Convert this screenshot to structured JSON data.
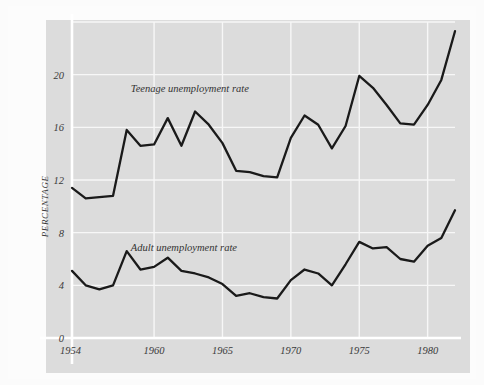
{
  "chart_data": {
    "type": "line",
    "title": "",
    "subtitle": "",
    "xlabel": "",
    "ylabel": "PERCENTAGE",
    "xlim": [
      1954,
      1982
    ],
    "ylim": [
      0,
      24
    ],
    "grid": true,
    "legend_position": "inline-annotation",
    "x_tick_labels": [
      "1954",
      "1960",
      "1965",
      "1970",
      "1975",
      "1980"
    ],
    "x_tick_values": [
      1954,
      1960,
      1965,
      1970,
      1975,
      1980
    ],
    "y_tick_labels": [
      "0",
      "4",
      "8",
      "12",
      "16",
      "20"
    ],
    "y_tick_values": [
      0,
      4,
      8,
      12,
      16,
      20
    ],
    "x": [
      1954,
      1955,
      1956,
      1957,
      1958,
      1959,
      1960,
      1961,
      1962,
      1963,
      1964,
      1965,
      1966,
      1967,
      1968,
      1969,
      1970,
      1971,
      1972,
      1973,
      1974,
      1975,
      1976,
      1977,
      1978,
      1979,
      1980,
      1981,
      1982
    ],
    "series": [
      {
        "name": "Teenage unemployment rate",
        "annotation": "Teenage unemployment rate",
        "color": "#1a1a1a",
        "values": [
          11.4,
          10.6,
          10.7,
          10.8,
          15.8,
          14.6,
          14.7,
          16.7,
          14.6,
          17.2,
          16.2,
          14.8,
          12.7,
          12.6,
          12.3,
          12.2,
          15.2,
          16.9,
          16.2,
          14.4,
          16.1,
          19.9,
          19.0,
          17.7,
          16.3,
          16.2,
          17.7,
          19.6,
          23.3
        ]
      },
      {
        "name": "Adult unemployment rate",
        "annotation": "Adult unemployment rate",
        "color": "#1a1a1a",
        "values": [
          5.1,
          4.0,
          3.7,
          4.0,
          6.6,
          5.2,
          5.4,
          6.1,
          5.1,
          4.9,
          4.6,
          4.1,
          3.2,
          3.4,
          3.1,
          3.0,
          4.4,
          5.2,
          4.9,
          4.0,
          5.6,
          7.3,
          6.8,
          6.9,
          6.0,
          5.8,
          7.0,
          7.6,
          9.7
        ]
      }
    ],
    "annotations": [
      {
        "text": "Teenage unemployment rate",
        "x": 1958.3,
        "y": 18.7
      },
      {
        "text": "Adult unemployment rate",
        "x": 1958.3,
        "y": 6.6
      }
    ]
  }
}
